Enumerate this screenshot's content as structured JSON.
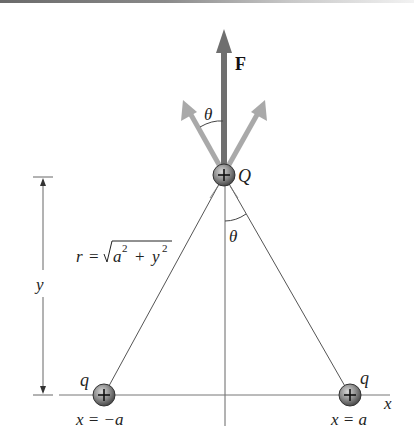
{
  "diagram": {
    "force_label": "F",
    "angle_label_top": "θ",
    "angle_label_bottom": "θ",
    "charge_center_label": "Q",
    "charge_left_label": "q",
    "charge_right_label": "q",
    "charge_sign": "+",
    "distance_label_r": "r",
    "distance_eq": "=",
    "distance_sqrt_a": "a",
    "distance_sqrt_plus": "+",
    "distance_sqrt_y": "y",
    "distance_exp": "2",
    "height_label": "y",
    "x_axis_label": "x",
    "left_position_label": "x = −a",
    "right_position_label": "x = a"
  },
  "colors": {
    "force_arrow": "#6f6f6f",
    "component_arrows": "#a9a9a9",
    "lines": "#555555",
    "charge_fill": "#8c8c8c"
  }
}
